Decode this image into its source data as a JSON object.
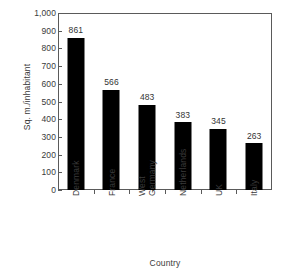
{
  "chart_data": {
    "type": "bar",
    "title": "",
    "xlabel": "Country",
    "ylabel": "Sq. m./inhabitant",
    "categories": [
      "Denmark",
      "France",
      "West Germany",
      "Netherlands",
      "UK",
      "Italy"
    ],
    "category_lines": [
      [
        "Denmark"
      ],
      [
        "France"
      ],
      [
        "West",
        "Germany"
      ],
      [
        "Netherlands"
      ],
      [
        "UK"
      ],
      [
        "Italy"
      ]
    ],
    "values": [
      861,
      566,
      483,
      383,
      345,
      263
    ],
    "value_labels": [
      "861",
      "566",
      "483",
      "383",
      "345",
      "263"
    ],
    "ylim": [
      0,
      1000
    ],
    "ytick_values": [
      0,
      100,
      200,
      300,
      400,
      500,
      600,
      700,
      800,
      900,
      1000
    ],
    "ytick_labels": [
      "0",
      "100",
      "200",
      "300",
      "400",
      "500",
      "600",
      "700",
      "800",
      "900",
      "1,000"
    ],
    "grid": false,
    "legend": false,
    "legend_position": "none",
    "bar_color": "#000000",
    "axis_color": "#5a5a5a",
    "text_color": "#333333",
    "background_color": "#ffffff"
  }
}
